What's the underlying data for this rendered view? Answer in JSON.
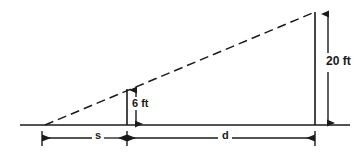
{
  "diagram": {
    "type": "geometric-line-diagram",
    "background_color": "#ffffff",
    "line_color": "#1a1a1a",
    "labels": {
      "height_tall": "20 ft",
      "height_short": "6 ft",
      "distance_short": "s",
      "distance_long": "d"
    },
    "geometry": {
      "ground_line": {
        "x1": 20,
        "y1": 125,
        "x2": 350,
        "y2": 125
      },
      "sight_line_dashed": {
        "x1": 45,
        "y1": 125,
        "x2": 315,
        "y2": 12
      },
      "short_pole": {
        "x": 127,
        "y_top": 89,
        "y_bottom": 125
      },
      "tall_pole": {
        "x": 315,
        "y_top": 12,
        "y_bottom": 125
      },
      "dim_line_20ft": {
        "x": 328,
        "y_top": 14,
        "y_bottom": 124
      },
      "dim_line_6ft": {
        "x": 136,
        "y_top": 90,
        "y_bottom": 124
      },
      "dim_line_s": {
        "y": 138,
        "x_left": 42,
        "x_right": 127
      },
      "dim_line_d": {
        "y": 138,
        "x_left": 127,
        "x_right": 315
      }
    }
  }
}
